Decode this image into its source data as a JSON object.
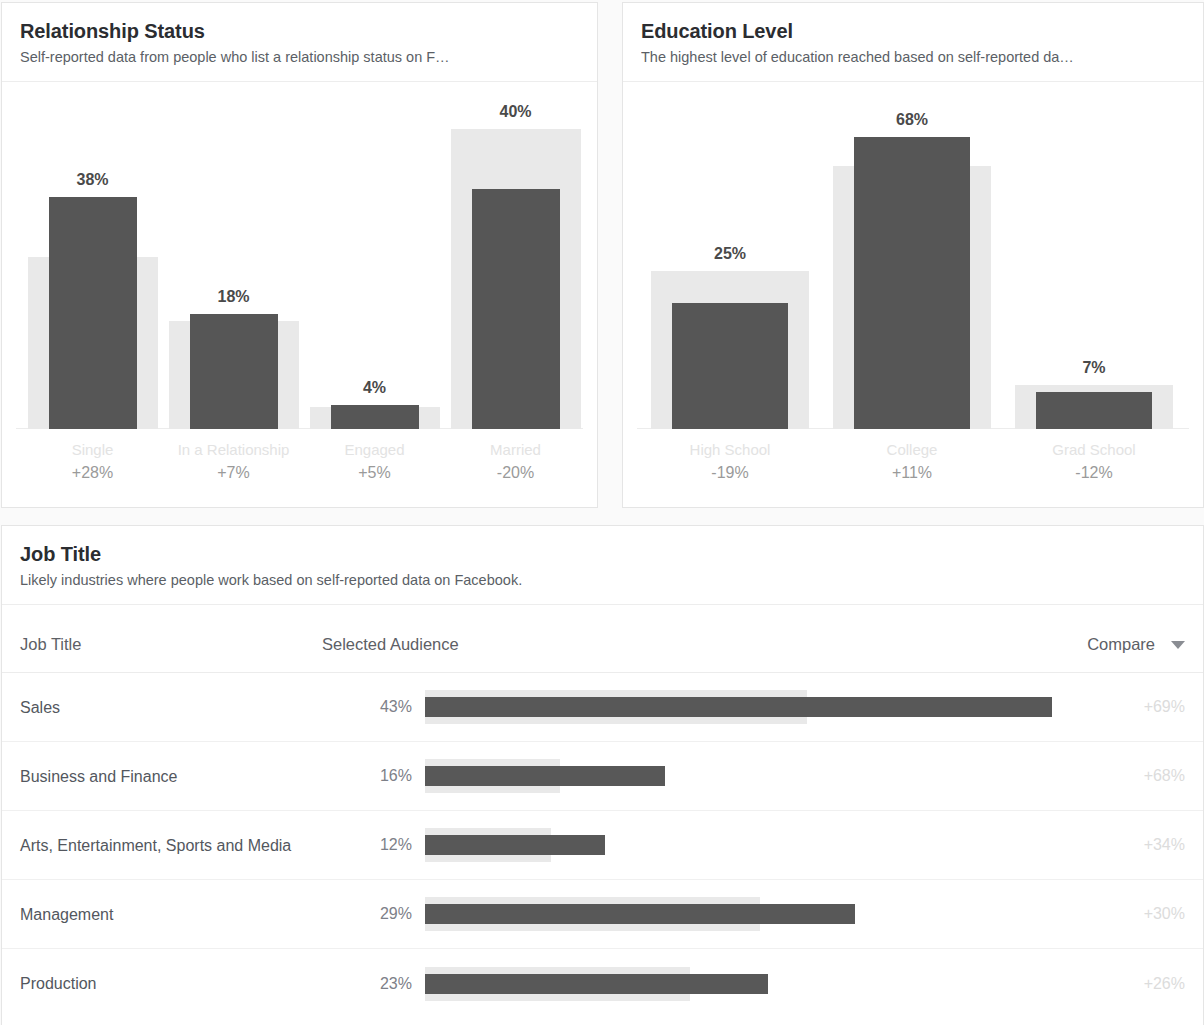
{
  "colors": {
    "bar_dark": "#565656",
    "bar_light": "#e9e9e9",
    "card_bg": "#ffffff",
    "page_bg": "#fafafa",
    "title": "#2b2d31",
    "muted": "#9a9a9a"
  },
  "cards": {
    "relationship": {
      "title": "Relationship Status",
      "subtitle": "Self-reported data from people who list a relationship status on F…"
    },
    "education": {
      "title": "Education Level",
      "subtitle": "The highest level of education reached based on self-reported da…"
    },
    "job_title": {
      "title": "Job Title",
      "subtitle": "Likely industries where people work based on self-reported data on Facebook.",
      "columns": {
        "job_title": "Job Title",
        "selected_audience": "Selected Audience",
        "compare": "Compare",
        "sort_icon": "caret-down-icon"
      }
    }
  },
  "chart_data": [
    {
      "type": "bar",
      "title": "Relationship Status",
      "subtitle": "Self-reported data from people who list a relationship status on F…",
      "xlabel": "",
      "ylabel": "",
      "ylim": [
        0,
        70
      ],
      "grid": false,
      "legend": null,
      "categories": [
        "Single",
        "In a Relationship",
        "Engaged",
        "Married"
      ],
      "tick_labels": [
        "Single",
        "In a Relationship",
        "Engaged",
        "Married"
      ],
      "series": [
        {
          "name": "Selected Audience",
          "values": [
            38,
            18,
            4,
            40
          ]
        },
        {
          "name": "Compare (all Facebook)",
          "values": [
            45,
            20,
            5,
            52
          ]
        }
      ],
      "data_labels": [
        "38%",
        "18%",
        "4%",
        "40%"
      ],
      "annotations": [
        "+28%",
        "+7%",
        "+5%",
        "-20%"
      ]
    },
    {
      "type": "bar",
      "title": "Education Level",
      "subtitle": "The highest level of education reached based on self-reported da…",
      "xlabel": "",
      "ylabel": "",
      "ylim": [
        0,
        70
      ],
      "grid": false,
      "legend": null,
      "categories": [
        "High School",
        "College",
        "Grad School"
      ],
      "tick_labels": [
        "High School",
        "College",
        "Grad School"
      ],
      "series": [
        {
          "name": "Selected Audience",
          "values": [
            25,
            68,
            7
          ]
        },
        {
          "name": "Compare (all Facebook)",
          "values": [
            31,
            60,
            9
          ]
        }
      ],
      "data_labels": [
        "25%",
        "68%",
        "7%"
      ],
      "annotations": [
        "-19%",
        "+11%",
        "-12%"
      ]
    },
    {
      "type": "bar",
      "orientation": "horizontal",
      "title": "Job Title",
      "subtitle": "Likely industries where people work based on self-reported data on Facebook.",
      "categories": [
        "Sales",
        "Business and Finance",
        "Arts, Entertainment, Sports and Media",
        "Management",
        "Production"
      ],
      "series": [
        {
          "name": "Selected Audience",
          "values": [
            43,
            16,
            12,
            29,
            23
          ]
        },
        {
          "name": "Compare",
          "values": [
            26,
            9.5,
            9,
            22,
            18
          ]
        }
      ],
      "data_labels": [
        "43%",
        "16%",
        "12%",
        "29%",
        "23%"
      ],
      "annotations": [
        "+69%",
        "+68%",
        "+34%",
        "+30%",
        "+26%"
      ]
    }
  ],
  "relationship_chart": {
    "bars": [
      {
        "category": "Single",
        "value_label": "38%",
        "value": 38,
        "compare_label": "+28%",
        "bar_height_px": 232,
        "compare_height_px": 172,
        "left_px": 20,
        "width_px": 141,
        "bar_width_px": 88
      },
      {
        "category": "In a Relationship",
        "value_label": "18%",
        "value": 18,
        "compare_label": "+7%",
        "bar_height_px": 115,
        "compare_height_px": 108,
        "left_px": 161,
        "width_px": 141,
        "bar_width_px": 88
      },
      {
        "category": "Engaged",
        "value_label": "4%",
        "value": 4,
        "compare_label": "+5%",
        "bar_height_px": 24,
        "compare_height_px": 22,
        "left_px": 302,
        "width_px": 141,
        "bar_width_px": 88
      },
      {
        "category": "Married",
        "value_label": "40%",
        "value": 40,
        "compare_label": "-20%",
        "bar_height_px": 240,
        "compare_height_px": 300,
        "left_px": 443,
        "width_px": 141,
        "bar_width_px": 88
      }
    ]
  },
  "education_chart": {
    "bars": [
      {
        "category": "High School",
        "value_label": "25%",
        "value": 25,
        "compare_label": "-19%",
        "bar_height_px": 126,
        "compare_height_px": 158,
        "left_px": 16,
        "width_px": 182,
        "bar_width_px": 116
      },
      {
        "category": "College",
        "value_label": "68%",
        "value": 68,
        "compare_label": "+11%",
        "bar_height_px": 292,
        "compare_height_px": 263,
        "left_px": 198,
        "width_px": 182,
        "bar_width_px": 116
      },
      {
        "category": "Grad School",
        "value_label": "7%",
        "value": 7,
        "compare_label": "-12%",
        "bar_height_px": 37,
        "compare_height_px": 44,
        "left_px": 380,
        "width_px": 182,
        "bar_width_px": 116
      }
    ]
  },
  "job_title_rows": [
    {
      "name": "Sales",
      "audience": "43%",
      "compare": "+69%",
      "bar_width_px": 627,
      "compare_width_px": 382
    },
    {
      "name": "Business and Finance",
      "audience": "16%",
      "compare": "+68%",
      "bar_width_px": 240,
      "compare_width_px": 135
    },
    {
      "name": "Arts, Entertainment, Sports and Media",
      "audience": "12%",
      "compare": "+34%",
      "bar_width_px": 180,
      "compare_width_px": 126
    },
    {
      "name": "Management",
      "audience": "29%",
      "compare": "+30%",
      "bar_width_px": 430,
      "compare_width_px": 335
    },
    {
      "name": "Production",
      "audience": "23%",
      "compare": "+26%",
      "bar_width_px": 343,
      "compare_width_px": 265
    }
  ]
}
